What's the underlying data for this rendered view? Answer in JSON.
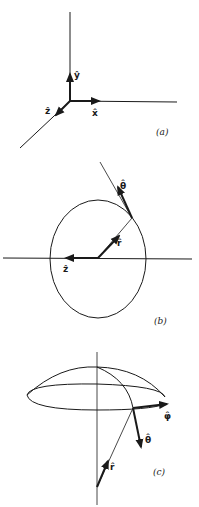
{
  "figure": {
    "panels": [
      {
        "id": "a",
        "caption": "(a)",
        "labels": {
          "y": "ŷ",
          "x": "x̂",
          "z": "ẑ"
        }
      },
      {
        "id": "b",
        "caption": "(b)",
        "labels": {
          "theta": "θ̂",
          "r": "r̂",
          "z": "ẑ"
        }
      },
      {
        "id": "c",
        "caption": "(c)",
        "labels": {
          "phi": "φ̂",
          "theta": "θ̂",
          "r": "r̂"
        }
      }
    ],
    "colors": {
      "ink": "#1a1a1a",
      "background": "#ffffff"
    }
  }
}
